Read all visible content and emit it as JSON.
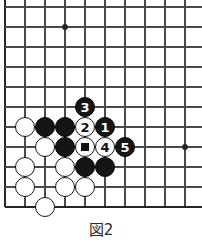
{
  "figure": {
    "caption": "図2",
    "kind": "go-board-diagram"
  },
  "board": {
    "origin_x": 5,
    "origin_y": 7,
    "spacing": 20,
    "cols": 10,
    "rows": 11,
    "line_color": "#4a4a4a",
    "edge_color": "#262626",
    "background": "#ffffff",
    "line_width": 1.3,
    "edge_width": 2.6,
    "stone_radius": 10,
    "star_points": [
      {
        "name": "star-point-upper",
        "col": 3,
        "row": 1
      },
      {
        "name": "star-point-lower",
        "col": 9,
        "row": 7
      }
    ]
  },
  "stones": [
    {
      "id": "white-a",
      "color": "white",
      "col": 1,
      "row": 6,
      "label": "",
      "mark": ""
    },
    {
      "id": "black-a",
      "color": "black",
      "col": 2,
      "row": 6,
      "label": "",
      "mark": ""
    },
    {
      "id": "black-b",
      "color": "black",
      "col": 3,
      "row": 6,
      "label": "",
      "mark": ""
    },
    {
      "id": "white-b",
      "color": "white",
      "col": 2,
      "row": 7,
      "label": "",
      "mark": ""
    },
    {
      "id": "black-c",
      "color": "black",
      "col": 3,
      "row": 7,
      "label": "",
      "mark": ""
    },
    {
      "id": "white-c",
      "color": "white",
      "col": 1,
      "row": 8,
      "label": "",
      "mark": ""
    },
    {
      "id": "white-d",
      "color": "white",
      "col": 3,
      "row": 8,
      "label": "",
      "mark": ""
    },
    {
      "id": "black-d",
      "color": "black",
      "col": 4,
      "row": 8,
      "label": "",
      "mark": ""
    },
    {
      "id": "black-e",
      "color": "black",
      "col": 5,
      "row": 8,
      "label": "",
      "mark": ""
    },
    {
      "id": "white-e",
      "color": "white",
      "col": 1,
      "row": 9,
      "label": "",
      "mark": ""
    },
    {
      "id": "white-f",
      "color": "white",
      "col": 3,
      "row": 9,
      "label": "",
      "mark": ""
    },
    {
      "id": "white-g",
      "color": "white",
      "col": 4,
      "row": 9,
      "label": "",
      "mark": ""
    },
    {
      "id": "white-h",
      "color": "white",
      "col": 2,
      "row": 10,
      "label": "",
      "mark": ""
    },
    {
      "id": "move-3",
      "color": "black",
      "col": 4,
      "row": 5,
      "label": "3",
      "mark": ""
    },
    {
      "id": "move-2",
      "color": "white",
      "col": 4,
      "row": 6,
      "label": "2",
      "mark": ""
    },
    {
      "id": "move-1",
      "color": "black",
      "col": 5,
      "row": 6,
      "label": "1",
      "mark": ""
    },
    {
      "id": "marked-white-square",
      "color": "white",
      "col": 4,
      "row": 7,
      "label": "",
      "mark": "square"
    },
    {
      "id": "move-4",
      "color": "white",
      "col": 5,
      "row": 7,
      "label": "4",
      "mark": ""
    },
    {
      "id": "move-5",
      "color": "black",
      "col": 6,
      "row": 7,
      "label": "5",
      "mark": ""
    }
  ]
}
